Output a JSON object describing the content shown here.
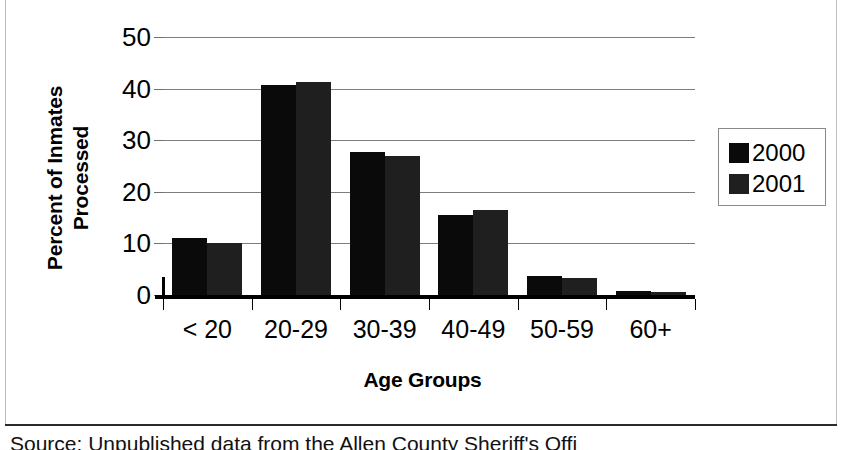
{
  "chart_data": {
    "type": "bar",
    "title": "",
    "xlabel": "Age Groups",
    "ylabel": "Percent of Inmates\nProcessed",
    "categories": [
      "< 20",
      "20-29",
      "30-39",
      "40-49",
      "50-59",
      "60+"
    ],
    "series": [
      {
        "name": "2000",
        "color": "#0a0a0a",
        "values": [
          11.0,
          40.7,
          27.7,
          15.5,
          3.6,
          0.7
        ]
      },
      {
        "name": "2001",
        "color": "#1f1f1f",
        "values": [
          10.0,
          41.3,
          26.9,
          16.5,
          3.3,
          0.6
        ]
      }
    ],
    "ylim": [
      0,
      50
    ],
    "yticks": [
      0,
      10,
      20,
      30,
      40,
      50
    ],
    "ytick_labels": [
      "0",
      "10",
      "20",
      "30",
      "40",
      "50"
    ],
    "grid": true,
    "legend_position": "right"
  },
  "legend": {
    "entries": [
      {
        "label": "2000",
        "color": "#0a0a0a"
      },
      {
        "label": "2001",
        "color": "#1f1f1f"
      }
    ]
  },
  "caption": {
    "text": "Source: Unpublished data from the Allen County Sheriff's Offi"
  }
}
